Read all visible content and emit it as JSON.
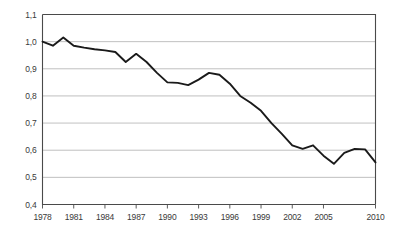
{
  "chart_data": {
    "type": "line",
    "title": "",
    "subtitle": "",
    "xlabel": "",
    "ylabel": "",
    "xlim": [
      1978,
      2010
    ],
    "ylim": [
      0.4,
      1.1
    ],
    "grid": true,
    "legend": false,
    "decimal_separator": ",",
    "y_ticks": [
      0.4,
      0.5,
      0.6,
      0.7,
      0.8,
      0.9,
      1.0,
      1.1
    ],
    "y_tick_labels": [
      "0,4",
      "0,5",
      "0,6",
      "0,7",
      "0,8",
      "0,9",
      "1,0",
      "1,1"
    ],
    "x_ticks": [
      1978,
      1981,
      1984,
      1987,
      1990,
      1993,
      1996,
      1999,
      2002,
      2005,
      2010
    ],
    "x_tick_labels": [
      "1978",
      "1981",
      "1984",
      "1987",
      "1990",
      "1993",
      "1996",
      "1999",
      "2002",
      "2005",
      "2010"
    ],
    "x": [
      1978,
      1979,
      1980,
      1981,
      1982,
      1983,
      1984,
      1985,
      1986,
      1987,
      1988,
      1989,
      1990,
      1991,
      1992,
      1993,
      1994,
      1995,
      1996,
      1997,
      1998,
      1999,
      2000,
      2001,
      2002,
      2003,
      2004,
      2005,
      2006,
      2007,
      2008,
      2009,
      2010
    ],
    "values": [
      1.0,
      0.985,
      1.015,
      0.985,
      0.978,
      0.972,
      0.968,
      0.962,
      0.925,
      0.955,
      0.925,
      0.885,
      0.85,
      0.848,
      0.84,
      0.86,
      0.885,
      0.878,
      0.845,
      0.8,
      0.775,
      0.745,
      0.7,
      0.66,
      0.618,
      0.605,
      0.618,
      0.58,
      0.55,
      0.59,
      0.605,
      0.603,
      0.555
    ],
    "series": [
      {
        "name": "series-1",
        "color": "#1a1a1a",
        "values": [
          1.0,
          0.985,
          1.015,
          0.985,
          0.978,
          0.972,
          0.968,
          0.962,
          0.925,
          0.955,
          0.925,
          0.885,
          0.85,
          0.848,
          0.84,
          0.86,
          0.885,
          0.878,
          0.845,
          0.8,
          0.775,
          0.745,
          0.7,
          0.66,
          0.618,
          0.605,
          0.618,
          0.58,
          0.55,
          0.59,
          0.605,
          0.603,
          0.555
        ]
      }
    ],
    "colors": {
      "line": "#1a1a1a",
      "grid": "#b0b0b0",
      "axis": "#4a4a4a",
      "tick_text": "#3a3a3a",
      "background": "#ffffff"
    }
  }
}
